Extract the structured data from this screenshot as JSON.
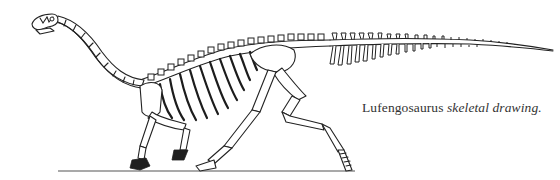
{
  "figure": {
    "illustration_style": "line-drawing",
    "ground_line": true,
    "caption": {
      "genus": "Lufengosaurus",
      "description": "skeletal drawing."
    },
    "colors": {
      "ink": "#222222",
      "background": "#ffffff",
      "caption_text": "#333333"
    }
  }
}
